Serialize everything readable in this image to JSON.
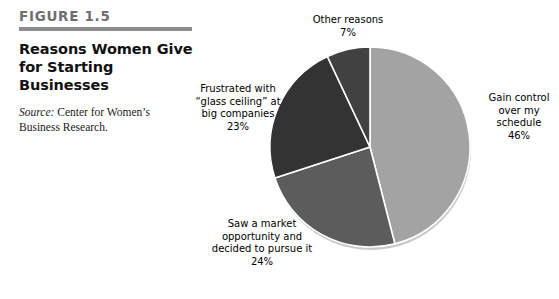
{
  "figure": {
    "number": "FIGURE 1.5",
    "title": "Reasons Women Give\nfor Starting Businesses",
    "source_label": "Source:",
    "source_text": " Center for Women’s Business Research."
  },
  "colors": {
    "rule": "#8c8c8c",
    "slice_gain": "#a3a3a3",
    "slice_market": "#5c5c5c",
    "slice_frustrated": "#333333",
    "slice_other": "#414141",
    "slice_edge": "#ffffff",
    "shadow": "#c9c9c9"
  },
  "chart_data": {
    "type": "pie",
    "title": "Reasons Women Give for Starting Businesses",
    "source": "Center for Women’s Business Research.",
    "legend": "none",
    "start_angle_deg": 0,
    "direction": "clockwise",
    "center": [
      200,
      147
    ],
    "radius": 100,
    "categories": [
      "Gain control over my schedule",
      "Saw a market opportunity and decided to pursue it",
      "Frustrated with “glass ceiling” at big companies",
      "Other reasons"
    ],
    "values": [
      46,
      24,
      23,
      7
    ],
    "unit": "%",
    "slices": [
      {
        "id": "gain",
        "label": "Gain control\nover my\nschedule",
        "value": 46,
        "value_text": "46%",
        "color": "#a3a3a3",
        "angle_deg": 165.6
      },
      {
        "id": "market",
        "label": "Saw a market\nopportunity and\ndecided to pursue it",
        "value": 24,
        "value_text": "24%",
        "color": "#5c5c5c",
        "angle_deg": 86.4
      },
      {
        "id": "frustrated",
        "label": "Frustrated with\n“glass ceiling” at\nbig companies",
        "value": 23,
        "value_text": "23%",
        "color": "#333333",
        "angle_deg": 82.8
      },
      {
        "id": "other",
        "label": "Other reasons",
        "value": 7,
        "value_text": "7%",
        "color": "#414141",
        "angle_deg": 25.2
      }
    ]
  },
  "labels": {
    "other": "Other reasons\n7%",
    "gain": "Gain control\nover my\nschedule\n46%",
    "frustrated": "Frustrated with\n“glass ceiling” at\nbig companies\n23%",
    "market": "Saw a market\nopportunity and\ndecided to pursue it\n24%"
  }
}
